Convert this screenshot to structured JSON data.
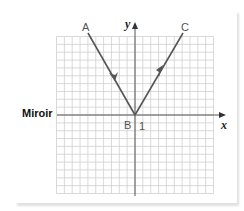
{
  "figure": {
    "mirror_label": "Miroir",
    "points": {
      "A": {
        "label": "A",
        "x": -6,
        "y": 11
      },
      "B": {
        "label": "B",
        "x": 0,
        "y": 0
      },
      "C": {
        "label": "C",
        "x": 6,
        "y": 11
      }
    },
    "x_axis_label": "x",
    "y_axis_label": "y",
    "tick_label": "1",
    "grid": {
      "cols_left": 10,
      "cols_right": 10,
      "rows_up": 10,
      "rows_down": 10
    },
    "colors": {
      "ray": "#555555",
      "grid": "#cfcfcf",
      "axis": "#555555"
    }
  }
}
